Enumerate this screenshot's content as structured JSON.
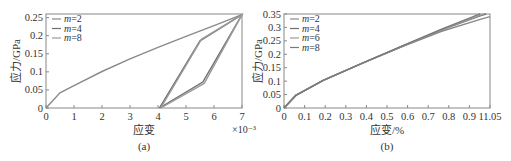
{
  "chart_data": [
    {
      "type": "line",
      "panel_label": "(a)",
      "title": "",
      "xlabel": "应变",
      "ylabel": "应力/GPa",
      "x_multiplier": "×10⁻³",
      "xlim": [
        0,
        7
      ],
      "ylim": [
        0,
        0.26
      ],
      "xticks": [
        "0",
        "1",
        "2",
        "3",
        "4",
        "5",
        "6",
        "7"
      ],
      "yticks": [
        "0",
        "0.05",
        "0.1",
        "0.15",
        "0.2",
        "0.25"
      ],
      "legend": [
        "m=2",
        "m=4",
        "m=8"
      ],
      "legend_position": "upper-left",
      "grid": false,
      "series": [
        {
          "name": "m=2",
          "color": "#8a8a8a",
          "x": [
            0,
            0.5,
            1,
            2,
            3,
            4,
            5,
            6,
            7
          ],
          "y": [
            0,
            0.042,
            0.062,
            0.101,
            0.136,
            0.168,
            0.198,
            0.228,
            0.258
          ]
        },
        {
          "name": "m=4",
          "color": "#6e6e6e",
          "x": [
            4.05,
            5.5,
            7,
            5.6,
            4.05
          ],
          "y": [
            0,
            0.186,
            0.258,
            0.072,
            0
          ]
        },
        {
          "name": "m=8",
          "color": "#9a9a9a",
          "x": [
            4.1,
            5.55,
            7,
            5.65,
            4.1
          ],
          "y": [
            0,
            0.19,
            0.258,
            0.068,
            0
          ]
        }
      ]
    },
    {
      "type": "line",
      "panel_label": "(b)",
      "title": "",
      "xlabel": "应变/%",
      "ylabel": "应力/GPa",
      "xlim": [
        0,
        1.05
      ],
      "ylim": [
        0,
        0.35
      ],
      "xticks": [
        "0",
        "0.1",
        "0.2",
        "0.3",
        "0.4",
        "0.5",
        "0.6",
        "0.7",
        "0.8",
        "0.9",
        "11.05"
      ],
      "yticks": [
        "0",
        "0.05",
        "0.1",
        "0.15",
        "0.2",
        "0.25",
        "0.3",
        "0.35"
      ],
      "legend": [
        "m=2",
        "m=4",
        "m=6",
        "m=8"
      ],
      "legend_position": "upper-left",
      "grid": false,
      "series": [
        {
          "name": "m=2",
          "color": "#8a8a8a",
          "x": [
            0,
            0.06,
            0.2,
            0.4,
            0.6,
            0.8,
            1.0,
            1.05
          ],
          "y": [
            0,
            0.047,
            0.103,
            0.167,
            0.228,
            0.285,
            0.33,
            0.34
          ]
        },
        {
          "name": "m=4",
          "color": "#6e6e6e",
          "x": [
            0,
            0.06,
            0.2,
            0.4,
            0.6,
            0.8,
            1.0,
            1.03
          ],
          "y": [
            0,
            0.047,
            0.103,
            0.167,
            0.229,
            0.29,
            0.343,
            0.35
          ]
        },
        {
          "name": "m=6",
          "color": "#9a9a9a",
          "x": [
            0,
            0.06,
            0.2,
            0.4,
            0.6,
            0.8,
            1.0,
            1.02
          ],
          "y": [
            0,
            0.047,
            0.103,
            0.167,
            0.229,
            0.291,
            0.345,
            0.35
          ]
        },
        {
          "name": "m=8",
          "color": "#7a7a7a",
          "x": [
            0,
            0.06,
            0.2,
            0.4,
            0.6,
            0.8,
            0.98,
            1.0
          ],
          "y": [
            0,
            0.047,
            0.103,
            0.167,
            0.23,
            0.293,
            0.345,
            0.35
          ]
        }
      ]
    }
  ]
}
